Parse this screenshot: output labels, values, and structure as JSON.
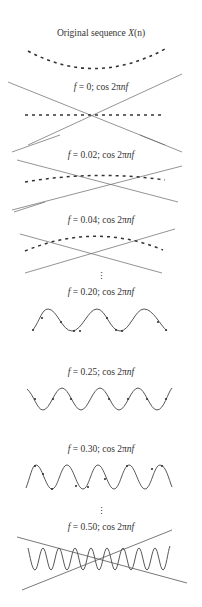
{
  "figure": {
    "title": "Original sequence X(n)",
    "panels": [
      {
        "id": "original",
        "label": "Original sequence X(n)",
        "kind": "sequence"
      },
      {
        "id": "f0",
        "f": "0",
        "label": "f = 0; cos 2πnf",
        "kind": "crossed"
      },
      {
        "id": "f002",
        "f": "0.02",
        "label": "f = 0.02; cos 2πnf",
        "kind": "crossed"
      },
      {
        "id": "f004",
        "f": "0.04",
        "label": "f = 0.04; cos 2πnf",
        "kind": "crossed"
      },
      {
        "id": "f020",
        "f": "0.20",
        "label": "f = 0.20; cos 2πnf",
        "kind": "wave"
      },
      {
        "id": "f025",
        "f": "0.25",
        "label": "f = 0.25; cos 2πnf",
        "kind": "wave"
      },
      {
        "id": "f030",
        "f": "0.30",
        "label": "f = 0.30; cos 2πnf",
        "kind": "wave"
      },
      {
        "id": "f050",
        "f": "0.50",
        "label": "f = 0.50; cos 2πnf",
        "kind": "crossed-wave"
      }
    ],
    "ellipsis": [
      "⋮",
      "⋮"
    ],
    "colors": {
      "line": "#555555",
      "dash": "#333333",
      "text": "#333333",
      "background": "#ffffff"
    }
  },
  "labels": {
    "original": {
      "pre": "Original sequence ",
      "var": "X",
      "post": "(n)"
    },
    "f0": {
      "var": "f",
      "eq": " = 0; cos 2π",
      "nf": "nf"
    },
    "f002": {
      "var": "f",
      "eq": " = 0.02; cos 2π",
      "nf": "nf"
    },
    "f004": {
      "var": "f",
      "eq": " = 0.04; cos 2π",
      "nf": "nf"
    },
    "f020": {
      "var": "f",
      "eq": " = 0.20; cos 2π",
      "nf": "nf"
    },
    "f025": {
      "var": "f",
      "eq": " = 0.25; cos 2π",
      "nf": "nf"
    },
    "f030": {
      "var": "f",
      "eq": " = 0.30; cos 2π",
      "nf": "nf"
    },
    "f050": {
      "var": "f",
      "eq": " = 0.50; cos 2π",
      "nf": "nf"
    }
  }
}
